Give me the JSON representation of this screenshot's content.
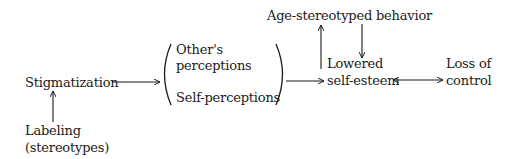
{
  "diagram": {
    "type": "flowchart",
    "nodes": {
      "stigmatization": "Stigmatization",
      "labeling_line1": "Labeling",
      "labeling_line2": "(stereotypes)",
      "others_perceptions_line1": "Other's",
      "others_perceptions_line2": "perceptions",
      "self_perceptions": "Self-perceptions",
      "age_stereotyped": "Age-stereotyped behavior",
      "lowered_line1": "Lowered",
      "lowered_line2": "self-esteem",
      "loss_line1": "Loss of",
      "loss_line2": "control"
    },
    "edges": [
      {
        "from": "Labeling (stereotypes)",
        "to": "Stigmatization",
        "type": "arrow"
      },
      {
        "from": "Stigmatization",
        "to": "Other's perceptions / Self-perceptions",
        "type": "arrow"
      },
      {
        "from": "Other's perceptions / Self-perceptions",
        "to": "Lowered self-esteem",
        "type": "arrow"
      },
      {
        "from": "Lowered self-esteem",
        "to": "Age-stereotyped behavior",
        "type": "arrow"
      },
      {
        "from": "Age-stereotyped behavior",
        "to": "Lowered self-esteem",
        "type": "arrow"
      },
      {
        "from": "Lowered self-esteem",
        "to": "Loss of control",
        "type": "bidirectional"
      }
    ],
    "colors": {
      "ink": "#1a1a1a",
      "background": "#ffffff"
    }
  }
}
